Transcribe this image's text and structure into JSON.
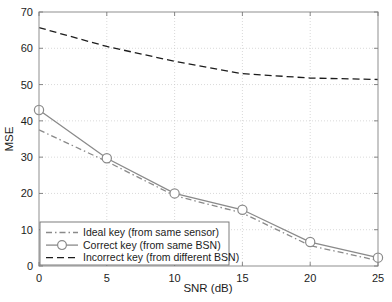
{
  "chart_data": {
    "type": "line",
    "title": "",
    "xlabel": "SNR (dB)",
    "ylabel": "MSE",
    "xlim": [
      0,
      25
    ],
    "ylim": [
      0,
      70
    ],
    "xticks": [
      0,
      5,
      10,
      15,
      20,
      25
    ],
    "yticks": [
      0,
      10,
      20,
      30,
      40,
      50,
      60,
      70
    ],
    "xticklabels": [
      "0",
      "5",
      "10",
      "15",
      "20",
      "25"
    ],
    "yticklabels": [
      "0",
      "10",
      "20",
      "30",
      "40",
      "50",
      "60",
      "70"
    ],
    "grid": true,
    "legend_position": "lower left",
    "x": [
      0,
      5,
      10,
      15,
      20,
      25
    ],
    "series": [
      {
        "name": "Ideal key (from same sensor)",
        "values": [
          37.5,
          28.8,
          19.4,
          14.6,
          5.6,
          1.5
        ],
        "style": "dashdot",
        "color": "#8a8a8a",
        "marker": "none"
      },
      {
        "name": "Correct key (from same BSN)",
        "values": [
          43.0,
          29.7,
          20.0,
          15.5,
          6.6,
          2.3
        ],
        "style": "solid",
        "color": "#8a8a8a",
        "marker": "circle"
      },
      {
        "name": "Incorrect key (from different BSN)",
        "values": [
          65.7,
          60.5,
          56.4,
          53.0,
          51.8,
          51.4
        ],
        "style": "dashed",
        "color": "#1c1c1c",
        "marker": "none"
      }
    ]
  },
  "legend": {
    "entries": [
      "Ideal key (from same sensor)",
      "Correct key (from same BSN)",
      "Incorrect key (from different BSN)"
    ]
  },
  "axes": {
    "x_title": "SNR (dB)",
    "y_title": "MSE"
  }
}
